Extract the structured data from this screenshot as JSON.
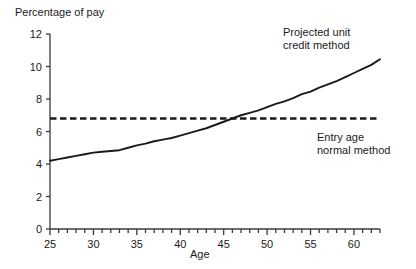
{
  "chart_data": {
    "type": "line",
    "title": "",
    "xlabel": "Age",
    "ylabel": "Percentage of pay",
    "xlim": [
      25,
      63
    ],
    "ylim": [
      0,
      12
    ],
    "grid": false,
    "legend_position": "inline-annotations",
    "x_ticks_major": [
      25,
      30,
      35,
      40,
      45,
      50,
      55,
      60
    ],
    "x_tick_labels": [
      "25",
      "30",
      "35",
      "40",
      "45",
      "50",
      "55",
      "60"
    ],
    "x_ticks_minor_step": 1,
    "y_ticks": [
      0,
      2,
      4,
      6,
      8,
      10,
      12
    ],
    "y_tick_labels": [
      "0",
      "2",
      "4",
      "6",
      "8",
      "10",
      "12"
    ],
    "series": [
      {
        "name": "Projected unit credit method",
        "style": "solid",
        "color": "#1a1a1a",
        "x": [
          25,
          26,
          27,
          28,
          29,
          30,
          31,
          32,
          33,
          34,
          35,
          36,
          37,
          38,
          39,
          40,
          41,
          42,
          43,
          44,
          45,
          46,
          47,
          48,
          49,
          50,
          51,
          52,
          53,
          54,
          55,
          56,
          57,
          58,
          59,
          60,
          61,
          62,
          63
        ],
        "values": [
          4.2,
          4.3,
          4.4,
          4.5,
          4.6,
          4.7,
          4.75,
          4.8,
          4.85,
          5.0,
          5.15,
          5.25,
          5.4,
          5.5,
          5.6,
          5.75,
          5.9,
          6.05,
          6.2,
          6.4,
          6.6,
          6.8,
          7.0,
          7.15,
          7.3,
          7.5,
          7.7,
          7.85,
          8.05,
          8.3,
          8.45,
          8.7,
          8.9,
          9.1,
          9.35,
          9.6,
          9.85,
          10.1,
          10.45
        ]
      },
      {
        "name": "Entry age normal method",
        "style": "dashed",
        "color": "#1a1a1a",
        "x": [
          25,
          63
        ],
        "values": [
          6.8,
          6.8
        ]
      }
    ],
    "annotations": [
      {
        "text": "Projected unit\ncredit method",
        "x": 52,
        "y": 11.3
      },
      {
        "text": "Entry age\nnormal method",
        "x": 56,
        "y": 5.1
      }
    ]
  },
  "axes": {
    "y_title": "Percentage of pay",
    "x_title": "Age"
  },
  "annotations": {
    "projected": "Projected unit\ncredit method",
    "entry_age": "Entry age\nnormal method"
  },
  "colors": {
    "line": "#1a1a1a",
    "axis": "#3a3a3a",
    "background": "#ffffff"
  }
}
